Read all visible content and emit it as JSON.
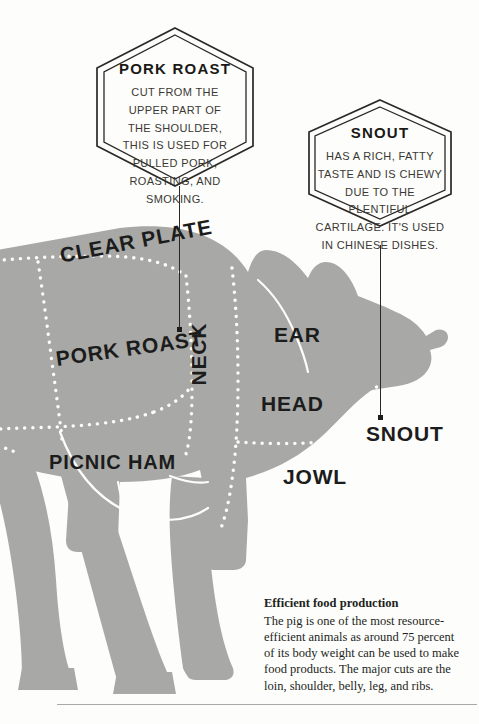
{
  "palette": {
    "background": "#fdfdfb",
    "pig_fill": "#a8a9a6",
    "ink": "#1c1c1c",
    "rule": "#a9a9a5"
  },
  "diagram": {
    "cut_labels": [
      {
        "id": "clear-plate",
        "text": "CLEAR PLATE"
      },
      {
        "id": "pork-roast",
        "text": "PORK ROAST"
      },
      {
        "id": "picnic-ham",
        "text": "PICNIC HAM"
      },
      {
        "id": "neck",
        "text": "NECK"
      },
      {
        "id": "ear",
        "text": "EAR"
      },
      {
        "id": "head",
        "text": "HEAD"
      },
      {
        "id": "jowl",
        "text": "JOWL"
      },
      {
        "id": "snout",
        "text": "SNOUT"
      }
    ]
  },
  "callouts": [
    {
      "id": "pork-roast",
      "title": "PORK ROAST",
      "body": "CUT FROM THE UPPER PART OF THE SHOULDER, THIS IS USED FOR PULLED PORK, ROASTING, AND SMOKING."
    },
    {
      "id": "snout",
      "title": "SNOUT",
      "body": "HAS A RICH, FATTY TASTE AND IS CHEWY DUE TO THE PLENTIFUL CARTILAGE. IT'S USED IN CHINESE DISHES."
    }
  ],
  "bottom_note": {
    "title": "Efficient food production",
    "body": "The pig is one of the most resource-efficient animals as around 75 percent of its body weight can be used to make food products. The major cuts are the loin, shoulder, belly, leg, and ribs."
  }
}
